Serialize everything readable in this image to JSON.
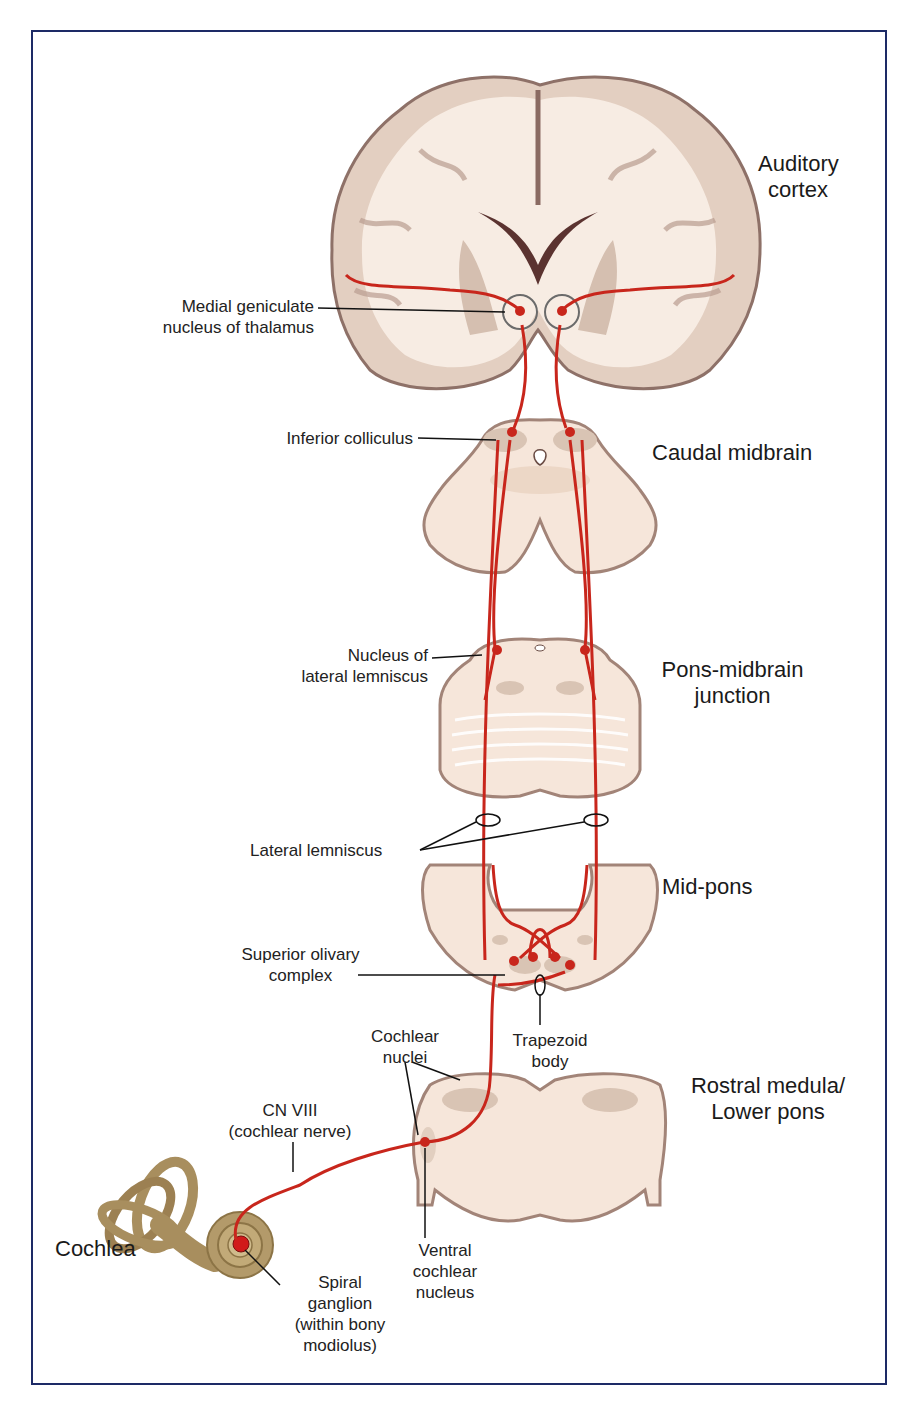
{
  "colors": {
    "frame_border": "#1d2a66",
    "pathway_red": "#c8261c",
    "tissue_light": "#f6e6da",
    "tissue_grey": "#d9c4b4",
    "tissue_edge": "#9b8076",
    "cochlea_tan": "#a88e5e"
  },
  "section_labels": {
    "auditory_cortex": [
      "Auditory",
      "cortex"
    ],
    "caudal_midbrain": "Caudal midbrain",
    "pons_midbrain_junction": [
      "Pons-midbrain",
      "junction"
    ],
    "mid_pons": "Mid-pons",
    "rostral_medulla": [
      "Rostral medula/",
      "Lower pons"
    ],
    "cochlea": "Cochlea"
  },
  "structure_labels": {
    "medial_geniculate": [
      "Medial geniculate",
      "nucleus of thalamus"
    ],
    "inferior_colliculus": "Inferior colliculus",
    "nucleus_lateral_lemniscus": [
      "Nucleus of",
      "lateral lemniscus"
    ],
    "lateral_lemniscus": "Lateral lemniscus",
    "superior_olivary": [
      "Superior olivary",
      "complex"
    ],
    "trapezoid_body": [
      "Trapezoid",
      "body"
    ],
    "cochlear_nuclei": [
      "Cochlear",
      "nuclei"
    ],
    "cn_viii": [
      "CN VIII",
      "(cochlear nerve)"
    ],
    "ventral_cochlear": [
      "Ventral",
      "cochlear",
      "nucleus"
    ],
    "spiral_ganglion": [
      "Spiral",
      "ganglion",
      "(within bony",
      "modiolus)"
    ]
  }
}
